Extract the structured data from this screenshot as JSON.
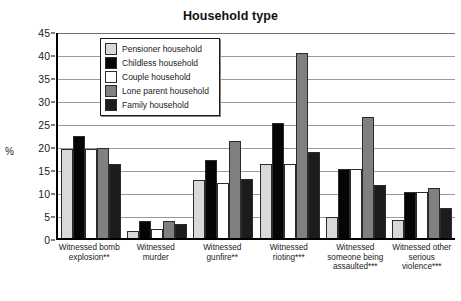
{
  "chart_data": {
    "type": "bar",
    "title": "Household type",
    "xlabel": "",
    "ylabel": "%",
    "ylim": [
      0,
      45
    ],
    "ytick_step": 5,
    "yticks": [
      45,
      40,
      35,
      30,
      25,
      20,
      15,
      10,
      5,
      0
    ],
    "grid": true,
    "legend_position": "top-left-inside",
    "categories": [
      "Witnessed bomb explosion**",
      "Witnessed murder",
      "Witnessed gunfire**",
      "Witnessed rioting***",
      "Witnessed someone being assaulted***",
      "Witnessed other serious violence***"
    ],
    "series": [
      {
        "name": "Pensioner household",
        "color": "#d9d9d9",
        "values": [
          19.3,
          1.5,
          12.6,
          16.0,
          4.5,
          3.9
        ]
      },
      {
        "name": "Childless household",
        "color": "#050505",
        "values": [
          22.2,
          3.7,
          17.0,
          25.1,
          14.9,
          10.0
        ]
      },
      {
        "name": "Couple household",
        "color": "#ffffff",
        "values": [
          19.3,
          2.0,
          12.0,
          16.0,
          15.0,
          10.0
        ]
      },
      {
        "name": "Lone parent household",
        "color": "#808080",
        "values": [
          19.5,
          3.7,
          21.0,
          40.2,
          26.3,
          10.8
        ]
      },
      {
        "name": "Family household",
        "color": "#1c1c1c",
        "values": [
          16.0,
          3.1,
          12.8,
          18.8,
          11.5,
          6.5
        ]
      }
    ]
  }
}
